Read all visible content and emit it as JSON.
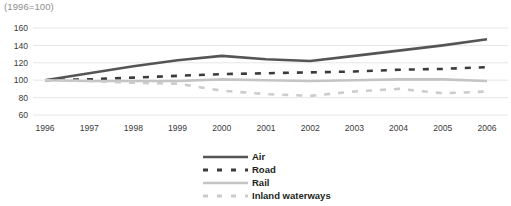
{
  "unit_note": "(1996=100)",
  "chart_data": {
    "type": "line",
    "title": "",
    "subtitle": "(1996=100)",
    "xlabel": "",
    "ylabel": "",
    "categories": [
      "1996",
      "1997",
      "1998",
      "1999",
      "2000",
      "2001",
      "2002",
      "2003",
      "2004",
      "2005",
      "2006"
    ],
    "x": [
      1996,
      1997,
      1998,
      1999,
      2000,
      2001,
      2002,
      2003,
      2004,
      2005,
      2006
    ],
    "ylim": [
      60,
      160
    ],
    "yticks": [
      60,
      80,
      100,
      120,
      140,
      160
    ],
    "grid": true,
    "legend_position": "bottom",
    "series": [
      {
        "name": "Air",
        "color": "#555555",
        "style": "solid",
        "values": [
          100,
          108,
          116,
          123,
          128,
          124,
          122,
          128,
          134,
          140,
          147
        ]
      },
      {
        "name": "Road",
        "color": "#3b3b3b",
        "style": "dashed",
        "values": [
          100,
          101,
          103,
          105,
          107,
          108,
          109,
          110,
          112,
          113,
          115
        ]
      },
      {
        "name": "Rail",
        "color": "#c4c4c4",
        "style": "solid",
        "values": [
          100,
          99,
          99,
          99,
          101,
          100,
          99,
          100,
          101,
          101,
          99
        ]
      },
      {
        "name": "Inland waterways",
        "color": "#cccccc",
        "style": "dashed",
        "values": [
          100,
          99,
          97,
          96,
          88,
          84,
          82,
          87,
          90,
          85,
          87
        ]
      }
    ]
  },
  "legend": {
    "items": [
      {
        "label": "Air"
      },
      {
        "label": "Road"
      },
      {
        "label": "Rail"
      },
      {
        "label": "Inland waterways"
      }
    ]
  }
}
